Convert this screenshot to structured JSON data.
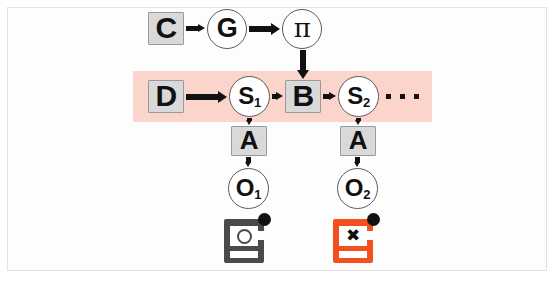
{
  "figure": {
    "background_color": "#ffffff",
    "frame_color": "#e2e2e2"
  },
  "palette": {
    "band_pink": "#fbd4cb",
    "square_fill": "#d9d9d9",
    "square_border": "#9a9a9a",
    "circle_fill": "#ffffff",
    "circle_border": "#5a5a5a",
    "ink": "#111111",
    "device_gray": "#4a4a4a",
    "device_orange": "#f4501e"
  },
  "band": {
    "name": "highlight-band",
    "color": "#fbd4cb",
    "x": 133,
    "y": 71,
    "width": 299,
    "height": 51
  },
  "nodes": [
    {
      "id": "C",
      "label": "C",
      "sub": "",
      "shape": "square",
      "x": 148,
      "y": 12,
      "w": 36,
      "h": 33,
      "font": 30
    },
    {
      "id": "G",
      "label": "G",
      "sub": "",
      "shape": "circle",
      "x": 207,
      "y": 9,
      "w": 40,
      "h": 40,
      "font": 27
    },
    {
      "id": "pi",
      "label": "π",
      "sub": "",
      "shape": "circle",
      "x": 282,
      "y": 9,
      "w": 40,
      "h": 40,
      "font": 26
    },
    {
      "id": "D",
      "label": "D",
      "sub": "",
      "shape": "square",
      "x": 148,
      "y": 80,
      "w": 36,
      "h": 33,
      "font": 30
    },
    {
      "id": "S1",
      "label": "S",
      "sub": "1",
      "shape": "circle",
      "x": 229,
      "y": 76,
      "w": 41,
      "h": 41,
      "font": 24
    },
    {
      "id": "B",
      "label": "B",
      "sub": "",
      "shape": "square",
      "x": 285,
      "y": 80,
      "w": 36,
      "h": 33,
      "font": 30
    },
    {
      "id": "S2",
      "label": "S",
      "sub": "2",
      "shape": "circle",
      "x": 338,
      "y": 76,
      "w": 41,
      "h": 41,
      "font": 24
    },
    {
      "id": "A1",
      "label": "A",
      "sub": "",
      "shape": "square",
      "x": 231,
      "y": 126,
      "w": 36,
      "h": 30,
      "font": 26
    },
    {
      "id": "A2",
      "label": "A",
      "sub": "",
      "shape": "square",
      "x": 340,
      "y": 126,
      "w": 36,
      "h": 30,
      "font": 26
    },
    {
      "id": "O1",
      "label": "O",
      "sub": "1",
      "shape": "circle",
      "x": 228,
      "y": 168,
      "w": 41,
      "h": 41,
      "font": 24
    },
    {
      "id": "O2",
      "label": "O",
      "sub": "2",
      "shape": "circle",
      "x": 337,
      "y": 168,
      "w": 41,
      "h": 41,
      "font": 24
    }
  ],
  "edges": [
    {
      "from": "C",
      "to": "G",
      "direction": "right"
    },
    {
      "from": "G",
      "to": "pi",
      "direction": "right"
    },
    {
      "from": "pi",
      "to": "B",
      "direction": "down"
    },
    {
      "from": "D",
      "to": "S1",
      "direction": "right"
    },
    {
      "from": "S1",
      "to": "B",
      "direction": "right"
    },
    {
      "from": "B",
      "to": "S2",
      "direction": "right"
    },
    {
      "from": "S1",
      "to": "A1",
      "direction": "down"
    },
    {
      "from": "S2",
      "to": "A2",
      "direction": "down"
    },
    {
      "from": "A1",
      "to": "O1",
      "direction": "down"
    },
    {
      "from": "A2",
      "to": "O2",
      "direction": "down"
    }
  ],
  "ellipsis": {
    "name": "sequence-ellipsis",
    "dots": 3,
    "x": 386,
    "y": 94
  },
  "devices": [
    {
      "id": "device-ok",
      "label": "working-device-icon",
      "glyph": "ring",
      "color": "#4a4a4a",
      "x": 224,
      "y": 213
    },
    {
      "id": "device-failed",
      "label": "failed-device-icon",
      "glyph": "✖",
      "color": "#f4501e",
      "x": 333,
      "y": 213
    }
  ]
}
